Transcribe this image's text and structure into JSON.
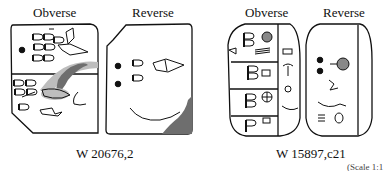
{
  "figures": [
    {
      "id": "left",
      "obverse_label": "Obverse",
      "reverse_label": "Reverse",
      "caption": "W 20676,2"
    },
    {
      "id": "right",
      "obverse_label": "Obverse",
      "reverse_label": "Reverse",
      "caption": "W 15897,c21"
    }
  ],
  "footer_fragment": "(Scale 1:1",
  "colors": {
    "ink": "#111111",
    "damage": "#6e6e6e",
    "damage_light": "#bdbdbd"
  }
}
